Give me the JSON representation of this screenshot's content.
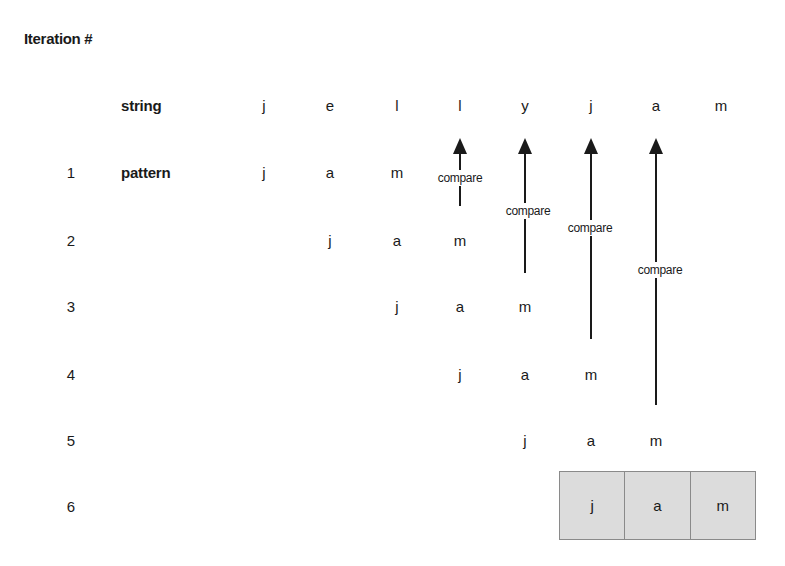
{
  "title": "Iteration #",
  "labels": {
    "string": "string",
    "pattern": "pattern"
  },
  "string_chars": [
    "j",
    "e",
    "l",
    "l",
    "y",
    "j",
    "a",
    "m"
  ],
  "pattern_chars": [
    "j",
    "a",
    "m"
  ],
  "iterations": [
    {
      "number": "1",
      "offset": 0,
      "chars": [
        "j",
        "a",
        "m"
      ]
    },
    {
      "number": "2",
      "offset": 1,
      "chars": [
        "j",
        "a",
        "m"
      ]
    },
    {
      "number": "3",
      "offset": 2,
      "chars": [
        "j",
        "a",
        "m"
      ]
    },
    {
      "number": "4",
      "offset": 3,
      "chars": [
        "j",
        "a",
        "m"
      ]
    },
    {
      "number": "5",
      "offset": 4,
      "chars": [
        "j",
        "a",
        "m"
      ]
    },
    {
      "number": "6",
      "offset": 5,
      "chars": [
        "j",
        "a",
        "m"
      ],
      "matched": true
    }
  ],
  "compare_label": "compare",
  "compare_arrows": [
    {
      "label": "compare",
      "column": 3,
      "from_iteration": 1
    },
    {
      "label": "compare",
      "column": 4,
      "from_iteration": 2
    },
    {
      "label": "compare",
      "column": 5,
      "from_iteration": 3
    },
    {
      "label": "compare",
      "column": 6,
      "from_iteration": 4
    }
  ],
  "colors": {
    "text": "#1a1a1a",
    "match_fill": "#dcdcdc",
    "match_border": "#8a8a8a"
  }
}
